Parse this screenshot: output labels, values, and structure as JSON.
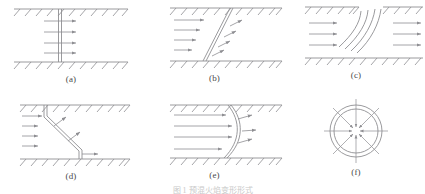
{
  "figure": {
    "caption_partial": "图 1 预混火焰变形形式",
    "panel_count": 6,
    "line_color": "#8e8e92",
    "label_color": "#4a4a4a",
    "background_color": "#ffffff"
  },
  "panels": [
    {
      "id": "a",
      "label": "(a)",
      "description": "flat vertical flame front in channel with horizontal flow arrows",
      "flame_shape": "straight-vertical",
      "arrow_count": 4,
      "arrow_direction": "right",
      "walls": [
        "top",
        "bottom"
      ]
    },
    {
      "id": "b",
      "label": "(b)",
      "description": "inclined planar flame front with upstream horizontal arrows and tilted downstream arrows",
      "flame_shape": "inclined-plane",
      "arrow_count": 4,
      "arrow_direction": "right",
      "walls": [
        "top",
        "bottom"
      ]
    },
    {
      "id": "c",
      "label": "(c)",
      "description": "curved flame arcs issuing from gap in upper wall with flow arrows both sides",
      "flame_shape": "curved-arcs",
      "arrow_count": 6,
      "arrow_direction": "right",
      "walls": [
        "top-left",
        "top-right",
        "bottom"
      ]
    },
    {
      "id": "d",
      "label": "(d)",
      "description": "kinked z-shaped flame front with inflow arrows and oblique arrows",
      "flame_shape": "kinked-z",
      "arrow_count": 5,
      "arrow_direction": "right",
      "walls": [
        "top",
        "bottom"
      ]
    },
    {
      "id": "e",
      "label": "(e)",
      "description": "convex curved flame front bulging downstream with oblique normal arrows",
      "flame_shape": "convex-curved",
      "arrow_count": 4,
      "arrow_direction": "right",
      "walls": [
        "top",
        "bottom"
      ]
    },
    {
      "id": "f",
      "label": "(f)",
      "description": "spherical flame front shown as concentric circles with inward radial arrows",
      "flame_shape": "spherical-concentric",
      "arrow_count": 8,
      "arrow_direction": "inward-radial",
      "walls": []
    }
  ]
}
